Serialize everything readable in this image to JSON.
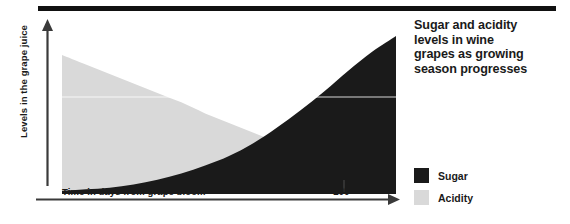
{
  "chart_data": {
    "type": "area",
    "title": "Sugar and acidity levels in wine grapes as growing season progresses",
    "title_lines": [
      "Sugar and acidity",
      "levels in wine",
      "grapes as growing",
      "season progresses"
    ],
    "xlabel": "Time in days from grape bloom",
    "ylabel": "Levels in the grape juice",
    "xticks": [
      "100"
    ],
    "xtick_values": [
      100
    ],
    "xlim": [
      0,
      140
    ],
    "ylim": [
      0,
      100
    ],
    "grid": false,
    "legend_position": "right",
    "x": [
      0,
      10,
      20,
      30,
      40,
      50,
      60,
      70,
      80,
      90,
      100,
      110,
      120,
      130,
      140
    ],
    "series": [
      {
        "name": "Sugar",
        "color": "#1a1a1a",
        "values": [
          2,
          3,
          4,
          6,
          9,
          13,
          18,
          24,
          32,
          42,
          53,
          65,
          78,
          90,
          100
        ]
      },
      {
        "name": "Acidity",
        "color": "#d9d9d9",
        "values": [
          88,
          82,
          76,
          70,
          64,
          58,
          51,
          45,
          39,
          33,
          27,
          22,
          17,
          13,
          10
        ]
      }
    ],
    "legend": [
      {
        "label": "Sugar",
        "color": "#1a1a1a"
      },
      {
        "label": "Acidity",
        "color": "#d9d9d9"
      }
    ]
  },
  "decor": {
    "top_rule_color": "#111111",
    "axis_color": "#3a3a3a"
  }
}
